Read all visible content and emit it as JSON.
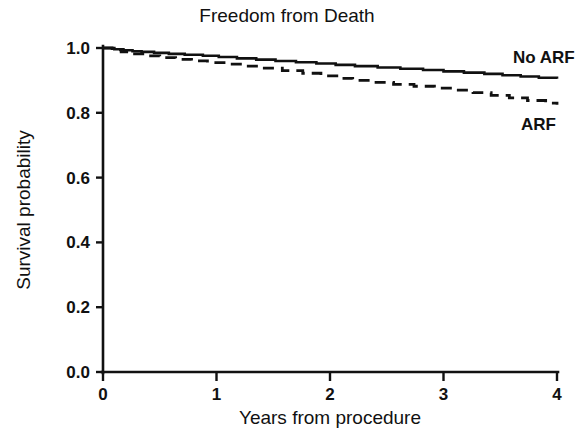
{
  "chart_data": {
    "type": "line",
    "title": "Freedom from Death",
    "xlabel": "Years from procedure",
    "ylabel": "Survival probability",
    "xlim": [
      0,
      4
    ],
    "ylim": [
      0.0,
      1.0
    ],
    "xticks": [
      "0",
      "1",
      "2",
      "3",
      "4"
    ],
    "xtick_values": [
      0,
      1,
      2,
      3,
      4
    ],
    "yticks": [
      "0.0",
      "0.2",
      "0.4",
      "0.6",
      "0.8",
      "1.0"
    ],
    "ytick_values": [
      0.0,
      0.2,
      0.4,
      0.6,
      0.8,
      1.0
    ],
    "grid": false,
    "legend_position": "inline-right",
    "plot_style": "kaplan-meier-step",
    "series": [
      {
        "name": "No ARF",
        "label": "No ARF",
        "linestyle": "solid",
        "color": "#111111",
        "x": [
          0.0,
          0.1,
          0.18,
          0.26,
          0.34,
          0.45,
          0.58,
          0.72,
          0.88,
          1.02,
          1.18,
          1.35,
          1.52,
          1.7,
          1.88,
          2.05,
          2.22,
          2.42,
          2.62,
          2.82,
          3.0,
          3.18,
          3.36,
          3.52,
          3.68,
          3.84,
          4.0
        ],
        "y": [
          1.0,
          0.996,
          0.993,
          0.99,
          0.988,
          0.985,
          0.982,
          0.979,
          0.976,
          0.972,
          0.968,
          0.964,
          0.96,
          0.956,
          0.952,
          0.948,
          0.944,
          0.94,
          0.936,
          0.932,
          0.928,
          0.924,
          0.92,
          0.916,
          0.912,
          0.908,
          0.905
        ]
      },
      {
        "name": "ARF",
        "label": "ARF",
        "linestyle": "dashed",
        "color": "#111111",
        "x": [
          0.0,
          0.08,
          0.16,
          0.26,
          0.38,
          0.5,
          0.64,
          0.78,
          0.92,
          1.08,
          1.24,
          1.4,
          1.58,
          1.76,
          1.92,
          2.06,
          2.2,
          2.38,
          2.56,
          2.74,
          2.92,
          3.1,
          3.26,
          3.42,
          3.58,
          3.74,
          3.9,
          4.0
        ],
        "y": [
          1.0,
          0.994,
          0.988,
          0.982,
          0.976,
          0.97,
          0.965,
          0.96,
          0.955,
          0.95,
          0.944,
          0.938,
          0.93,
          0.922,
          0.914,
          0.906,
          0.9,
          0.894,
          0.888,
          0.882,
          0.876,
          0.87,
          0.862,
          0.854,
          0.846,
          0.838,
          0.83,
          0.825
        ]
      }
    ]
  },
  "figure": {
    "background_color": "#ffffff",
    "foreground_color": "#111111",
    "note_no_arf_truncated": true
  }
}
